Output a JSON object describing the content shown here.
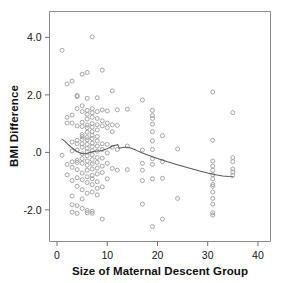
{
  "chart_data": {
    "type": "scatter",
    "title": "",
    "xlabel": "Size of Maternal Descent Group",
    "ylabel": "BMI Difference",
    "xlim": [
      -1.5,
      42.5
    ],
    "ylim": [
      -3.1,
      4.9
    ],
    "xticks": [
      0,
      10,
      20,
      30,
      40
    ],
    "xtick_labels": [
      "0",
      "10",
      "20",
      "30",
      "40"
    ],
    "yticks": [
      4.0,
      2.0,
      0.0,
      -2.0
    ],
    "ytick_labels": [
      "4.0",
      "2.0",
      ".0",
      "-2.0"
    ],
    "grid": false,
    "legend": "none",
    "marker": "open-circle",
    "marker_color": "#9b9b9b",
    "fit_line_color": "#585858",
    "fit_line_type": "lowess",
    "points": [
      [
        1,
        3.55
      ],
      [
        1,
        -0.1
      ],
      [
        2,
        2.38
      ],
      [
        2,
        1.22
      ],
      [
        2,
        1.02
      ],
      [
        2,
        -0.42
      ],
      [
        2,
        -0.78
      ],
      [
        3,
        2.48
      ],
      [
        3,
        1.3
      ],
      [
        3,
        1.02
      ],
      [
        3,
        0.36
      ],
      [
        3,
        0.05
      ],
      [
        3,
        -0.33
      ],
      [
        3,
        -0.52
      ],
      [
        3,
        -0.98
      ],
      [
        3,
        -1.52
      ],
      [
        3,
        -1.82
      ],
      [
        3,
        -2.08
      ],
      [
        4,
        1.98
      ],
      [
        4,
        1.94
      ],
      [
        4,
        1.52
      ],
      [
        4,
        0.92
      ],
      [
        4,
        0.42
      ],
      [
        4,
        0.3
      ],
      [
        4,
        0.08
      ],
      [
        4,
        -0.28
      ],
      [
        4,
        -0.35
      ],
      [
        4,
        -0.6
      ],
      [
        4,
        -0.88
      ],
      [
        4,
        -1.18
      ],
      [
        4,
        -1.85
      ],
      [
        4,
        -2.12
      ],
      [
        5,
        2.72
      ],
      [
        5,
        1.62
      ],
      [
        5,
        1.42
      ],
      [
        5,
        1.05
      ],
      [
        5,
        0.9
      ],
      [
        5,
        0.62
      ],
      [
        5,
        0.55
      ],
      [
        5,
        0.45
      ],
      [
        5,
        0.3
      ],
      [
        5,
        0.18
      ],
      [
        5,
        -0.05
      ],
      [
        5,
        -0.22
      ],
      [
        5,
        -0.38
      ],
      [
        5,
        -0.72
      ],
      [
        5,
        -0.95
      ],
      [
        5,
        -1.3
      ],
      [
        5,
        -1.62
      ],
      [
        5,
        -1.95
      ],
      [
        6,
        2.78
      ],
      [
        6,
        1.88
      ],
      [
        6,
        1.46
      ],
      [
        6,
        1.32
      ],
      [
        6,
        1.16
      ],
      [
        6,
        0.95
      ],
      [
        6,
        0.86
      ],
      [
        6,
        0.7
      ],
      [
        6,
        0.52
      ],
      [
        6,
        0.44
      ],
      [
        6,
        0.28
      ],
      [
        6,
        0.14
      ],
      [
        6,
        0.02
      ],
      [
        6,
        -0.12
      ],
      [
        6,
        -0.3
      ],
      [
        6,
        -0.45
      ],
      [
        6,
        -0.62
      ],
      [
        6,
        -0.85
      ],
      [
        6,
        -1.05
      ],
      [
        6,
        -1.42
      ],
      [
        6,
        -2.02
      ],
      [
        6,
        -2.1
      ],
      [
        7,
        4.02
      ],
      [
        7,
        1.52
      ],
      [
        7,
        1.38
      ],
      [
        7,
        1.22
      ],
      [
        7,
        1.0
      ],
      [
        7,
        0.88
      ],
      [
        7,
        0.72
      ],
      [
        7,
        0.6
      ],
      [
        7,
        0.48
      ],
      [
        7,
        0.32
      ],
      [
        7,
        0.2
      ],
      [
        7,
        0.06
      ],
      [
        7,
        -0.08
      ],
      [
        7,
        -0.25
      ],
      [
        7,
        -0.4
      ],
      [
        7,
        -0.58
      ],
      [
        7,
        -0.8
      ],
      [
        7,
        -0.92
      ],
      [
        7,
        -1.12
      ],
      [
        7,
        -1.38
      ],
      [
        7,
        -2.05
      ],
      [
        7,
        -2.12
      ],
      [
        8,
        1.9
      ],
      [
        8,
        1.42
      ],
      [
        8,
        1.18
      ],
      [
        8,
        0.96
      ],
      [
        8,
        0.78
      ],
      [
        8,
        0.55
      ],
      [
        8,
        0.4
      ],
      [
        8,
        0.22
      ],
      [
        8,
        0.04
      ],
      [
        8,
        -0.18
      ],
      [
        8,
        -0.35
      ],
      [
        8,
        -0.55
      ],
      [
        8,
        -0.75
      ],
      [
        8,
        -1.02
      ],
      [
        8,
        -1.25
      ],
      [
        8,
        -1.48
      ],
      [
        9,
        2.86
      ],
      [
        9,
        1.48
      ],
      [
        9,
        1.1
      ],
      [
        9,
        0.92
      ],
      [
        9,
        0.3
      ],
      [
        9,
        0.1
      ],
      [
        9,
        -0.2
      ],
      [
        9,
        -0.48
      ],
      [
        9,
        -0.7
      ],
      [
        9,
        -1.2
      ],
      [
        9,
        -2.32
      ],
      [
        10,
        1.44
      ],
      [
        10,
        1.02
      ],
      [
        10,
        0.86
      ],
      [
        10,
        0.28
      ],
      [
        10,
        -0.02
      ],
      [
        10,
        -0.38
      ],
      [
        10,
        -0.92
      ],
      [
        11,
        2.14
      ],
      [
        11,
        0.96
      ],
      [
        11,
        0.72
      ],
      [
        11,
        0.18
      ],
      [
        11,
        -0.56
      ],
      [
        12,
        1.48
      ],
      [
        12,
        0.94
      ],
      [
        12,
        0.1
      ],
      [
        12,
        -0.62
      ],
      [
        14,
        1.5
      ],
      [
        14,
        0.22
      ],
      [
        14,
        -0.6
      ],
      [
        17,
        1.82
      ],
      [
        17,
        0.08
      ],
      [
        17,
        -0.38
      ],
      [
        17,
        -0.62
      ],
      [
        17,
        -0.98
      ],
      [
        17,
        -1.8
      ],
      [
        19,
        1.46
      ],
      [
        19,
        1.28
      ],
      [
        19,
        1.18
      ],
      [
        19,
        0.98
      ],
      [
        19,
        0.72
      ],
      [
        19,
        0.4
      ],
      [
        19,
        0.1
      ],
      [
        19,
        -0.22
      ],
      [
        19,
        -0.42
      ],
      [
        19,
        -0.92
      ],
      [
        19,
        -2.58
      ],
      [
        21,
        0.58
      ],
      [
        21,
        -0.32
      ],
      [
        21,
        -0.9
      ],
      [
        21,
        -2.32
      ],
      [
        24,
        0.12
      ],
      [
        24,
        -1.6
      ],
      [
        31,
        2.1
      ],
      [
        31,
        0.42
      ],
      [
        31,
        -0.3
      ],
      [
        31,
        -0.48
      ],
      [
        31,
        -0.62
      ],
      [
        31,
        -0.78
      ],
      [
        31,
        -0.92
      ],
      [
        31,
        -1.12
      ],
      [
        31,
        -1.18
      ],
      [
        31,
        -1.38
      ],
      [
        31,
        -1.6
      ],
      [
        31,
        -1.8
      ],
      [
        31,
        -2.1
      ],
      [
        31,
        -2.18
      ],
      [
        35,
        1.38
      ],
      [
        35,
        -0.18
      ],
      [
        35,
        -0.32
      ],
      [
        35,
        -0.58
      ],
      [
        35,
        -0.68
      ],
      [
        35,
        -0.8
      ]
    ],
    "fit_line": [
      [
        1.0,
        0.46
      ],
      [
        1.6,
        0.38
      ],
      [
        2.2,
        0.28
      ],
      [
        2.8,
        0.18
      ],
      [
        3.4,
        0.1
      ],
      [
        4.0,
        0.03
      ],
      [
        4.6,
        -0.02
      ],
      [
        5.2,
        -0.05
      ],
      [
        5.8,
        -0.04
      ],
      [
        6.4,
        -0.01
      ],
      [
        7.0,
        0.02
      ],
      [
        7.6,
        0.04
      ],
      [
        8.2,
        0.05
      ],
      [
        8.8,
        0.06
      ],
      [
        9.4,
        0.09
      ],
      [
        10.0,
        0.13
      ],
      [
        10.6,
        0.18
      ],
      [
        11.2,
        0.23
      ],
      [
        11.8,
        0.26
      ],
      [
        12.1,
        0.27
      ],
      [
        12.4,
        0.14
      ],
      [
        12.8,
        0.16
      ],
      [
        13.4,
        0.18
      ],
      [
        14.0,
        0.18
      ],
      [
        14.8,
        0.14
      ],
      [
        15.8,
        0.07
      ],
      [
        17.0,
        -0.02
      ],
      [
        18.2,
        -0.1
      ],
      [
        19.4,
        -0.18
      ],
      [
        20.6,
        -0.25
      ],
      [
        22.0,
        -0.33
      ],
      [
        23.6,
        -0.41
      ],
      [
        25.2,
        -0.49
      ],
      [
        26.8,
        -0.57
      ],
      [
        28.4,
        -0.65
      ],
      [
        30.0,
        -0.72
      ],
      [
        31.6,
        -0.78
      ],
      [
        33.0,
        -0.82
      ],
      [
        34.2,
        -0.84
      ],
      [
        35.0,
        -0.85
      ]
    ]
  },
  "axes": {
    "x_title": "Size of Maternal Descent Group",
    "y_title": "BMI Difference"
  },
  "x_tick_labels": [
    "0",
    "10",
    "20",
    "30",
    "40"
  ],
  "y_tick_labels": [
    "4.0",
    "2.0",
    ".0",
    "-2.0"
  ]
}
